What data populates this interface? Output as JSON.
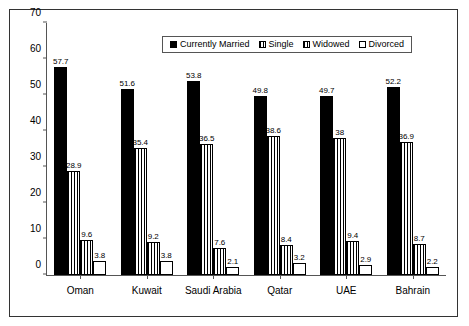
{
  "chart_data": {
    "type": "bar",
    "title": "",
    "xlabel": "",
    "ylabel": "",
    "ylim": [
      0,
      70
    ],
    "yticks": [
      0,
      10,
      20,
      30,
      40,
      50,
      60,
      70
    ],
    "grid": false,
    "legend_position": "top-center",
    "categories": [
      "Oman",
      "Kuwait",
      "Saudi Arabia",
      "Qatar",
      "UAE",
      "Bahrain"
    ],
    "series": [
      {
        "name": "Currently Married",
        "pattern": "solid",
        "values": [
          57.7,
          51.6,
          53.8,
          49.8,
          49.7,
          52.2
        ]
      },
      {
        "name": "Single",
        "pattern": "vlines",
        "values": [
          28.9,
          35.4,
          36.5,
          38.6,
          38.0,
          36.9
        ]
      },
      {
        "name": "Widowed",
        "pattern": "grid",
        "values": [
          9.6,
          9.2,
          7.6,
          8.4,
          9.4,
          8.7
        ]
      },
      {
        "name": "Divorced",
        "pattern": "empty",
        "values": [
          3.8,
          3.8,
          2.1,
          3.2,
          2.9,
          2.2
        ]
      }
    ],
    "data_labels": [
      [
        "57.7",
        "28.9",
        "9.6",
        "3.8"
      ],
      [
        "51.6",
        "35.4",
        "9.2",
        "3.8"
      ],
      [
        "53.8",
        "36.5",
        "7.6",
        "2.1"
      ],
      [
        "49.8",
        "38.6",
        "8.4",
        "3.2"
      ],
      [
        "49.7",
        "38",
        "9.4",
        "2.9"
      ],
      [
        "52.2",
        "36.9",
        "8.7",
        "2.2"
      ]
    ],
    "colors": {
      "bar_fill": "#000000",
      "bar_outline": "#000000",
      "axis": "#555555",
      "background": "#ffffff"
    }
  }
}
